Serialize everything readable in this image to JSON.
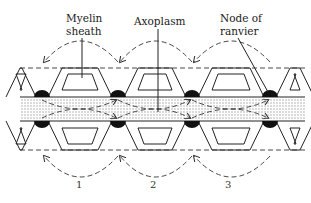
{
  "diagram": {
    "labels": {
      "myelin_line1": "Myelin",
      "myelin_line2": "sheath",
      "axoplasm": "Axoplasm",
      "node_line1": "Node of",
      "node_line2": "ranvier"
    },
    "steps": [
      "1",
      "2",
      "3"
    ],
    "colors": {
      "line": "#222222",
      "node": "#111111",
      "axoplasm_stipple": "#bdbdbd",
      "background": "#ffffff"
    }
  }
}
